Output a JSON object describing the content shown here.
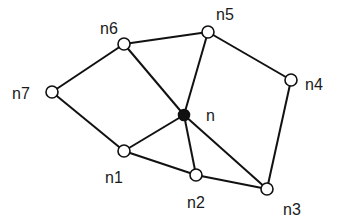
{
  "diagram": {
    "type": "graph",
    "nodes": [
      {
        "id": "n",
        "label": "n",
        "x": 184,
        "y": 115,
        "filled": true,
        "lx": 206,
        "ly": 121
      },
      {
        "id": "n1",
        "label": "n1",
        "x": 124,
        "y": 151,
        "filled": false,
        "lx": 105,
        "ly": 183
      },
      {
        "id": "n2",
        "label": "n2",
        "x": 196,
        "y": 175,
        "filled": false,
        "lx": 187,
        "ly": 208
      },
      {
        "id": "n3",
        "label": "n3",
        "x": 267,
        "y": 189,
        "filled": false,
        "lx": 283,
        "ly": 215
      },
      {
        "id": "n4",
        "label": "n4",
        "x": 291,
        "y": 80,
        "filled": false,
        "lx": 305,
        "ly": 90
      },
      {
        "id": "n5",
        "label": "n5",
        "x": 208,
        "y": 32,
        "filled": false,
        "lx": 216,
        "ly": 20
      },
      {
        "id": "n6",
        "label": "n6",
        "x": 124,
        "y": 44,
        "filled": false,
        "lx": 100,
        "ly": 34
      },
      {
        "id": "n7",
        "label": "n7",
        "x": 52,
        "y": 92,
        "filled": false,
        "lx": 12,
        "ly": 99
      }
    ],
    "edges": [
      [
        "n7",
        "n6"
      ],
      [
        "n6",
        "n5"
      ],
      [
        "n5",
        "n4"
      ],
      [
        "n4",
        "n3"
      ],
      [
        "n3",
        "n2"
      ],
      [
        "n2",
        "n1"
      ],
      [
        "n1",
        "n7"
      ],
      [
        "n",
        "n6"
      ],
      [
        "n",
        "n5"
      ],
      [
        "n",
        "n1"
      ],
      [
        "n",
        "n2"
      ],
      [
        "n",
        "n3"
      ]
    ],
    "colors": {
      "stroke": "#111111",
      "background": "#ffffff"
    }
  }
}
